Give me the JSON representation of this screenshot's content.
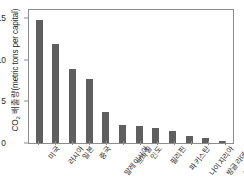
{
  "chart_data": {
    "type": "bar",
    "title": "",
    "xlabel": "",
    "ylabel_prefix": "CO",
    "ylabel_sub": "2",
    "ylabel_suffix": " 배출량(metric tons per capital)",
    "ylim": [
      0,
      16
    ],
    "yticks": [
      0,
      5,
      10,
      15
    ],
    "ytick_labels": [
      "0",
      "5",
      "10",
      "15"
    ],
    "grid": false,
    "legend": null,
    "bar_color": "#5f5f5f",
    "axis_color": "#8d8d8d",
    "categories": [
      "미국",
      "러시아",
      "일본",
      "중국",
      "말레이시아",
      "브라질",
      "인도",
      "필리핀",
      "파키스탄",
      "나이지리아",
      "방글라데시",
      "에티오피아"
    ],
    "values": [
      14.8,
      11.9,
      8.9,
      7.7,
      3.7,
      2.2,
      2.0,
      1.8,
      1.4,
      0.9,
      0.6,
      0.3
    ]
  }
}
